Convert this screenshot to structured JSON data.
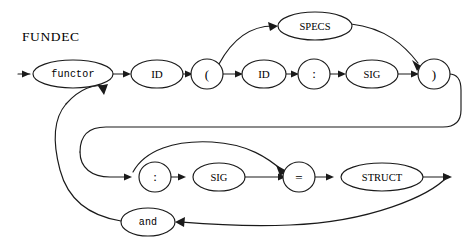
{
  "diagram": {
    "title": "FUNDEC",
    "type": "railroad-syntax-diagram",
    "colors": {
      "stroke": "#1a1a1a",
      "fill": "#ffffff",
      "background": "#ffffff",
      "text": "#000000"
    },
    "nodes": [
      {
        "id": "functor",
        "label": "functor",
        "shape": "ellipse",
        "font": "mono",
        "cx": 73,
        "cy": 74,
        "rx": 40,
        "ry": 14
      },
      {
        "id": "id1",
        "label": "ID",
        "shape": "ellipse",
        "font": "serif",
        "cx": 157,
        "cy": 74,
        "rx": 26,
        "ry": 14
      },
      {
        "id": "lparen",
        "label": "(",
        "shape": "circle",
        "font": "punct",
        "cx": 207,
        "cy": 74,
        "rx": 15,
        "ry": 15
      },
      {
        "id": "id2",
        "label": "ID",
        "shape": "ellipse",
        "font": "serif",
        "cx": 264,
        "cy": 74,
        "rx": 22,
        "ry": 14
      },
      {
        "id": "colon1",
        "label": ":",
        "shape": "circle",
        "font": "punct",
        "cx": 314,
        "cy": 74,
        "rx": 15,
        "ry": 15
      },
      {
        "id": "sig1",
        "label": "SIG",
        "shape": "ellipse",
        "font": "serif",
        "cx": 372,
        "cy": 74,
        "rx": 26,
        "ry": 14
      },
      {
        "id": "rparen",
        "label": ")",
        "shape": "circle",
        "font": "punct",
        "cx": 434,
        "cy": 74,
        "rx": 15,
        "ry": 15
      },
      {
        "id": "specs",
        "label": "SPECS",
        "shape": "ellipse",
        "font": "serif",
        "cx": 315,
        "cy": 26,
        "rx": 36,
        "ry": 14
      },
      {
        "id": "colon2",
        "label": ":",
        "shape": "circle",
        "font": "punct",
        "cx": 155,
        "cy": 177,
        "rx": 15,
        "ry": 15
      },
      {
        "id": "sig2",
        "label": "SIG",
        "shape": "ellipse",
        "font": "serif",
        "cx": 219,
        "cy": 177,
        "rx": 26,
        "ry": 14
      },
      {
        "id": "equals",
        "label": "=",
        "shape": "circle",
        "font": "punct",
        "cx": 299,
        "cy": 177,
        "rx": 15,
        "ry": 15
      },
      {
        "id": "struct",
        "label": "STRUCT",
        "shape": "ellipse",
        "font": "serif",
        "cx": 382,
        "cy": 177,
        "rx": 41,
        "ry": 14
      },
      {
        "id": "and",
        "label": "and",
        "shape": "ellipse",
        "font": "mono",
        "cx": 148,
        "cy": 222,
        "rx": 27,
        "ry": 14
      }
    ],
    "edges": [
      {
        "from": "start",
        "to": "functor"
      },
      {
        "from": "functor",
        "to": "id1"
      },
      {
        "from": "id1",
        "to": "lparen"
      },
      {
        "from": "lparen",
        "to": "id2"
      },
      {
        "from": "lparen",
        "to": "specs"
      },
      {
        "from": "id2",
        "to": "colon1"
      },
      {
        "from": "colon1",
        "to": "sig1"
      },
      {
        "from": "sig1",
        "to": "rparen"
      },
      {
        "from": "specs",
        "to": "rparen"
      },
      {
        "from": "rparen",
        "to": "colon2"
      },
      {
        "from": "rparen",
        "to": "equals"
      },
      {
        "from": "colon2",
        "to": "sig2"
      },
      {
        "from": "sig2",
        "to": "equals"
      },
      {
        "from": "equals",
        "to": "struct"
      },
      {
        "from": "struct",
        "to": "end"
      },
      {
        "from": "struct",
        "to": "and"
      },
      {
        "from": "and",
        "to": "functor"
      }
    ]
  }
}
